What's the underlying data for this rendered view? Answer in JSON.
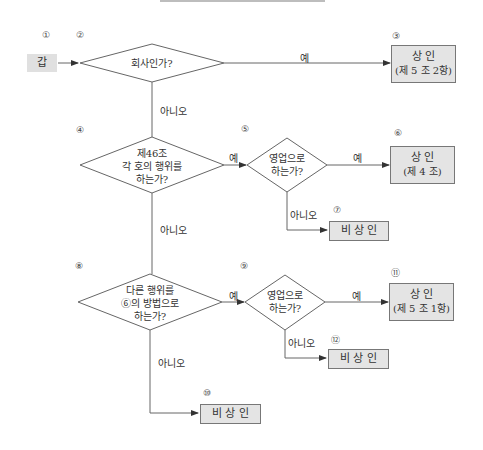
{
  "nodes": {
    "start": {
      "num": "①",
      "label": "갑"
    },
    "d1": {
      "num": "②",
      "text": "회사인가?"
    },
    "r1": {
      "num": "③",
      "line1": "상      인",
      "line2": "(제 5 조 2항)"
    },
    "d2": {
      "num": "④",
      "line1": "제46조",
      "line2": "각 호의 행위를",
      "line3": "하는가?"
    },
    "d3": {
      "num": "⑤",
      "line1": "영업으로",
      "line2": "하는가?"
    },
    "r2": {
      "num": "⑥",
      "line1": "상      인",
      "line2": "(제 4 조)"
    },
    "r3": {
      "num": "⑦",
      "label": "비 상 인"
    },
    "d4": {
      "num": "⑧",
      "line1": "다른 행위를",
      "line2": "⑥의 방법으로",
      "line3": "하는가?"
    },
    "d5": {
      "num": "⑨",
      "line1": "영업으로",
      "line2": "하는가?"
    },
    "r4": {
      "num": "⑩",
      "label": "비 상 인"
    },
    "r5": {
      "num": "⑪",
      "line1": "상      인",
      "line2": "(제 5 조 1항)"
    },
    "r6": {
      "num": "⑫",
      "label": "비 상 인"
    }
  },
  "edges": {
    "yes": "예",
    "no": "아니오"
  }
}
